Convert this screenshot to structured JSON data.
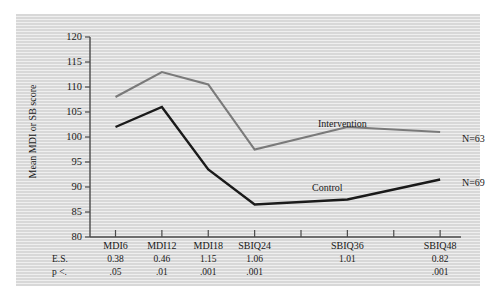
{
  "chart_data": {
    "type": "line",
    "title": "",
    "xlabel": "",
    "ylabel": "Mean MDI or SB score",
    "ylim": [
      80,
      120
    ],
    "yticks": [
      80,
      85,
      90,
      95,
      100,
      105,
      110,
      115,
      120
    ],
    "grid": false,
    "legend_position": "inline-annotations",
    "categories": [
      "MDI6",
      "MDI12",
      "MDI18",
      "SBIQ24",
      "SBIQ36",
      "SBIQ48"
    ],
    "category_slots": [
      0,
      1,
      2,
      3,
      5,
      7
    ],
    "n_axis_ticks": 8,
    "series": [
      {
        "name": "Intervention",
        "values": [
          108,
          113,
          110.5,
          97.5,
          102,
          101
        ],
        "n_label": "N=63",
        "color": "#7a7a7a"
      },
      {
        "name": "Control",
        "values": [
          102,
          106,
          93.5,
          86.5,
          87.5,
          91.5
        ],
        "n_label": "N=69",
        "color": "#1a1a1a"
      }
    ],
    "annotation_rows": [
      {
        "label": "E.S.",
        "values": [
          "0.38",
          "0.46",
          "1.15",
          "1.06",
          "1.01",
          "0.82"
        ]
      },
      {
        "label": "p <.",
        "values": [
          ".05",
          ".01",
          ".001",
          ".001",
          "",
          ".001"
        ]
      }
    ]
  },
  "colors": {
    "intervention_line": "#7a7a7a",
    "control_line": "#1a1a1a",
    "axis": "#4a4a4a",
    "text": "#1a1a1a",
    "panel_stripe_dark": "#d8d8d8",
    "panel_stripe_light": "#efefef",
    "page_background": "#ffffff"
  }
}
